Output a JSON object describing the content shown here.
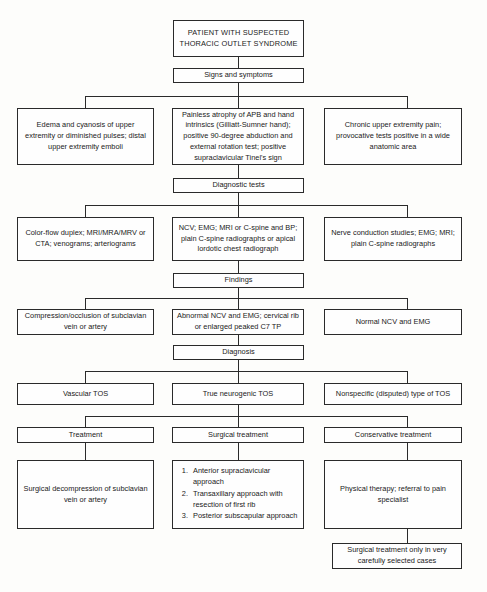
{
  "diagram": {
    "nodes": {
      "root": "PATIENT WITH SUSPECTED THORACIC OUTLET SYNDROME",
      "signs_label": "Signs and symptoms",
      "signs_vascular": "Edema and cyanosis of upper extremity or diminished pulses; distal upper extremity emboli",
      "signs_neurogenic": "Painless atrophy of APB and hand intrinsics (Gilliatt-Sumner hand); positive 90-degree abduction and external rotation test; positive supraclavicular Tinel's sign",
      "signs_nonspecific": "Chronic upper extremity pain; provocative tests positive in a wide anatomic area",
      "tests_label": "Diagnostic tests",
      "tests_vascular": "Color-flow duplex; MRI/MRA/MRV or CTA; venograms; arteriograms",
      "tests_neurogenic": "NCV; EMG; MRI or C-spine and BP; plain C-spine radiographs or apical lordotic chest radiograph",
      "tests_nonspecific": "Nerve conduction studies; EMG; MRI; plain C-spine radiographs",
      "findings_label": "Findings",
      "findings_vascular": "Compression/occlusion of subclavian vein or artery",
      "findings_neurogenic": "Abnormal NCV and EMG; cervical rib or enlarged peaked C7 TP",
      "findings_nonspecific": "Normal NCV and EMG",
      "diagnosis_label": "Diagnosis",
      "diagnosis_vascular": "Vascular TOS",
      "diagnosis_neurogenic": "True neurogenic TOS",
      "diagnosis_nonspecific": "Nonspecific (disputed) type of TOS",
      "treatment_vascular_label": "Treatment",
      "treatment_neurogenic_label": "Surgical treatment",
      "treatment_nonspecific_label": "Conservative treatment",
      "treatment_vascular_detail": "Surgical decompression of subclavian vein or artery",
      "treatment_nonspecific_detail": "Physical therapy; referral to pain specialist",
      "treatment_nonspecific_footnote": "Surgical treatment only in very carefully selected cases"
    },
    "surgical_approaches": [
      "Anterior supraclavicular approach",
      "Transaxillary approach with resection of first rib",
      "Posterior subscapular approach"
    ],
    "colors": {
      "stroke": "#2a2a2a",
      "box_fill": "#fefefe",
      "page_bg": "#fdfdfb",
      "text": "#1a1a1a"
    }
  }
}
